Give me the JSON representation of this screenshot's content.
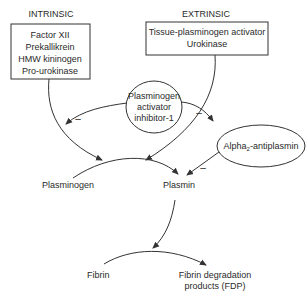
{
  "diagram": {
    "intrinsic": {
      "heading": "INTRINSIC",
      "items": [
        "Factor XII",
        "Prekallikrein",
        "HMW kininogen",
        "Pro-urokinase"
      ]
    },
    "extrinsic": {
      "heading": "EXTRINSIC",
      "items": [
        "Tissue-plasminogen activator",
        "Urokinase"
      ]
    },
    "inhibitor": {
      "lines": [
        "Plasminogen",
        "activator",
        "inhibitor-1"
      ]
    },
    "antiplasmin": {
      "prefix": "Alpha",
      "subscript": "2",
      "suffix": "-antiplasmin"
    },
    "plasminogen_label": "Plasminogen",
    "plasmin_label": "Plasmin",
    "fibrin_label": "Fibrin",
    "fdp": {
      "lines": [
        "Fibrin degradation",
        "products (FDP)"
      ]
    },
    "inhibition_mark": "–"
  }
}
